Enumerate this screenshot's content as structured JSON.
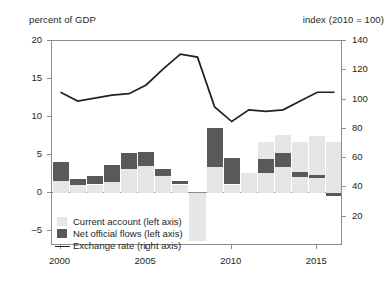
{
  "figure": {
    "left_axis_caption": "percent of GDP",
    "right_axis_caption": "index (2010 = 100)"
  },
  "legend": {
    "items": [
      {
        "label": "Current account (left axis)",
        "marker": "square-swatch-light",
        "color": "#e6e6e6"
      },
      {
        "label": "Net official flows (left axis)",
        "marker": "square-swatch-dark",
        "color": "#595959"
      },
      {
        "label": "Exchange rate (right axis)",
        "marker": "line-swatch",
        "color": "#231f20"
      }
    ]
  },
  "chart_data": {
    "type": "bar",
    "title": "",
    "subtitle": "",
    "xlabel": "",
    "ylabel": "percent of GDP",
    "y2label": "index (2010 = 100)",
    "grid": false,
    "legend_position": "inside-bottom-left",
    "stacked": true,
    "categories": [
      2000,
      2001,
      2002,
      2003,
      2004,
      2005,
      2006,
      2007,
      2008,
      2009,
      2010,
      2011,
      2012,
      2013,
      2014,
      2015,
      2016
    ],
    "x": [
      "2000",
      "2001",
      "2002",
      "2003",
      "2004",
      "2005",
      "2006",
      "2007",
      "2008",
      "2009",
      "2010",
      "2011",
      "2012",
      "2013",
      "2014",
      "2015",
      "2016"
    ],
    "xticks": [
      2000,
      2005,
      2010,
      2015
    ],
    "xtick_labels": [
      "2000",
      "2005",
      "2010",
      "2015"
    ],
    "xlim": [
      1999.5,
      2016.5
    ],
    "ylim": [
      -7.0,
      20.0
    ],
    "yticks": [
      -5,
      0,
      5,
      10,
      15,
      20
    ],
    "ytick_labels": [
      "-5",
      "0",
      "5",
      "10",
      "15",
      "20"
    ],
    "y2lim": [
      0,
      140
    ],
    "y2ticks": [
      20,
      40,
      60,
      80,
      100,
      120,
      140
    ],
    "y2tick_labels": [
      "20",
      "40",
      "60",
      "80",
      "100",
      "120",
      "140"
    ],
    "series": [
      {
        "name": "Current account (left axis)",
        "type": "bar",
        "axis": "left",
        "color": "#e6e6e6",
        "values": [
          1.6,
          1.0,
          1.1,
          1.4,
          3.2,
          3.6,
          2.2,
          1.1,
          -6.3,
          3.4,
          1.1,
          2.6,
          2.6,
          3.4,
          2.1,
          2.0,
          1.7
        ]
      },
      {
        "name": "Net official flows (left axis)",
        "type": "bar",
        "axis": "left",
        "color": "#595959",
        "values": [
          2.5,
          0.8,
          1.1,
          2.3,
          2.0,
          1.8,
          1.0,
          0.5,
          0.0,
          5.1,
          3.5,
          0.0,
          1.9,
          1.9,
          0.6,
          0.4,
          -0.4
        ]
      },
      {
        "name": "Current account stacked top (left axis)",
        "type": "bar-stack-top",
        "axis": "left",
        "color": "#e6e6e6",
        "values": [
          0.0,
          0.0,
          0.0,
          0.0,
          0.0,
          0.0,
          0.0,
          0.0,
          0.0,
          0.0,
          0.0,
          0.0,
          2.2,
          2.3,
          4.0,
          5.1,
          5.4
        ]
      },
      {
        "name": "Exchange rate (right axis)",
        "type": "line",
        "axis": "right",
        "color": "#231f20",
        "values": [
          105,
          99,
          101,
          103,
          104,
          110,
          121,
          131,
          129,
          95,
          85,
          93,
          92,
          93,
          99,
          105,
          105
        ]
      }
    ]
  }
}
